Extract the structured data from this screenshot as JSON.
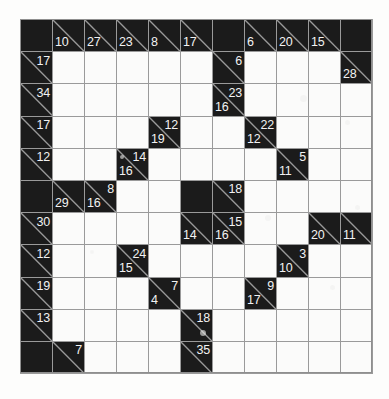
{
  "puzzle": {
    "type": "kakuro",
    "rows": 11,
    "cols": 11,
    "cell_size_px": 32,
    "colors": {
      "block": "#1b1b1b",
      "cell": "#fbfbfa",
      "gridline": "#9a9a9a",
      "clue_text": "#f2f2f2",
      "page_background": "#ffffff"
    },
    "grid": [
      [
        {
          "kind": "block"
        },
        {
          "kind": "clue",
          "down": "10"
        },
        {
          "kind": "clue",
          "down": "27"
        },
        {
          "kind": "clue",
          "down": "23"
        },
        {
          "kind": "clue",
          "down": "8"
        },
        {
          "kind": "clue",
          "down": "17"
        },
        {
          "kind": "block"
        },
        {
          "kind": "clue",
          "down": "6"
        },
        {
          "kind": "clue",
          "down": "20"
        },
        {
          "kind": "clue",
          "down": "15"
        },
        {
          "kind": "block"
        }
      ],
      [
        {
          "kind": "clue",
          "right": "17"
        },
        {
          "kind": "cell"
        },
        {
          "kind": "cell"
        },
        {
          "kind": "cell"
        },
        {
          "kind": "cell"
        },
        {
          "kind": "cell"
        },
        {
          "kind": "clue",
          "right": "6"
        },
        {
          "kind": "cell"
        },
        {
          "kind": "cell"
        },
        {
          "kind": "cell"
        },
        {
          "kind": "clue",
          "down": "28"
        }
      ],
      [
        {
          "kind": "clue",
          "right": "34"
        },
        {
          "kind": "cell"
        },
        {
          "kind": "cell"
        },
        {
          "kind": "cell"
        },
        {
          "kind": "cell"
        },
        {
          "kind": "cell"
        },
        {
          "kind": "clue",
          "right": "23",
          "down": "16"
        },
        {
          "kind": "cell"
        },
        {
          "kind": "cell"
        },
        {
          "kind": "cell"
        },
        {
          "kind": "cell"
        }
      ],
      [
        {
          "kind": "clue",
          "right": "17"
        },
        {
          "kind": "cell"
        },
        {
          "kind": "cell"
        },
        {
          "kind": "cell"
        },
        {
          "kind": "clue",
          "right": "12",
          "down": "19"
        },
        {
          "kind": "cell"
        },
        {
          "kind": "cell"
        },
        {
          "kind": "clue",
          "right": "22",
          "down": "12"
        },
        {
          "kind": "cell"
        },
        {
          "kind": "cell"
        },
        {
          "kind": "cell"
        }
      ],
      [
        {
          "kind": "clue",
          "right": "12"
        },
        {
          "kind": "cell"
        },
        {
          "kind": "cell"
        },
        {
          "kind": "clue",
          "right": "14",
          "down": "16"
        },
        {
          "kind": "cell"
        },
        {
          "kind": "cell"
        },
        {
          "kind": "cell"
        },
        {
          "kind": "cell"
        },
        {
          "kind": "clue",
          "right": "5",
          "down": "11"
        },
        {
          "kind": "cell"
        },
        {
          "kind": "cell"
        }
      ],
      [
        {
          "kind": "block"
        },
        {
          "kind": "clue",
          "down": "29"
        },
        {
          "kind": "clue",
          "right": "8",
          "down": "16"
        },
        {
          "kind": "cell"
        },
        {
          "kind": "cell"
        },
        {
          "kind": "block"
        },
        {
          "kind": "clue",
          "right": "18"
        },
        {
          "kind": "cell"
        },
        {
          "kind": "cell"
        },
        {
          "kind": "cell"
        },
        {
          "kind": "cell"
        }
      ],
      [
        {
          "kind": "clue",
          "right": "30"
        },
        {
          "kind": "cell"
        },
        {
          "kind": "cell"
        },
        {
          "kind": "cell"
        },
        {
          "kind": "cell"
        },
        {
          "kind": "clue",
          "down": "14"
        },
        {
          "kind": "clue",
          "right": "15",
          "down": "16"
        },
        {
          "kind": "cell"
        },
        {
          "kind": "cell"
        },
        {
          "kind": "clue",
          "down": "20"
        },
        {
          "kind": "clue",
          "down": "11"
        }
      ],
      [
        {
          "kind": "clue",
          "right": "12"
        },
        {
          "kind": "cell"
        },
        {
          "kind": "cell"
        },
        {
          "kind": "clue",
          "right": "24",
          "down": "15"
        },
        {
          "kind": "cell"
        },
        {
          "kind": "cell"
        },
        {
          "kind": "cell"
        },
        {
          "kind": "cell"
        },
        {
          "kind": "clue",
          "right": "3",
          "down": "10"
        },
        {
          "kind": "cell"
        },
        {
          "kind": "cell"
        }
      ],
      [
        {
          "kind": "clue",
          "right": "19"
        },
        {
          "kind": "cell"
        },
        {
          "kind": "cell"
        },
        {
          "kind": "cell"
        },
        {
          "kind": "clue",
          "right": "7",
          "down": "4"
        },
        {
          "kind": "cell"
        },
        {
          "kind": "cell"
        },
        {
          "kind": "clue",
          "right": "9",
          "down": "17"
        },
        {
          "kind": "cell"
        },
        {
          "kind": "cell"
        },
        {
          "kind": "cell"
        }
      ],
      [
        {
          "kind": "clue",
          "right": "13"
        },
        {
          "kind": "cell"
        },
        {
          "kind": "cell"
        },
        {
          "kind": "cell"
        },
        {
          "kind": "cell"
        },
        {
          "kind": "clue",
          "right": "18"
        },
        {
          "kind": "cell"
        },
        {
          "kind": "cell"
        },
        {
          "kind": "cell"
        },
        {
          "kind": "cell"
        },
        {
          "kind": "cell"
        }
      ],
      [
        {
          "kind": "block"
        },
        {
          "kind": "clue",
          "right": "7"
        },
        {
          "kind": "cell"
        },
        {
          "kind": "cell"
        },
        {
          "kind": "cell"
        },
        {
          "kind": "clue",
          "right": "35"
        },
        {
          "kind": "cell"
        },
        {
          "kind": "cell"
        },
        {
          "kind": "cell"
        },
        {
          "kind": "cell"
        },
        {
          "kind": "cell"
        }
      ]
    ]
  }
}
